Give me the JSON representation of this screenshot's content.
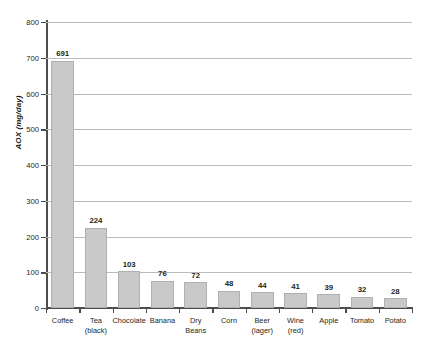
{
  "chart_data": {
    "type": "bar",
    "title": "",
    "xlabel": "",
    "ylabel": "AOX (mg/day)",
    "ylim": [
      0,
      800
    ],
    "ytick_values": [
      0,
      100,
      200,
      300,
      400,
      500,
      600,
      700,
      800
    ],
    "ytick_labels": [
      "0",
      "100",
      "200",
      "300",
      "400",
      "500",
      "600",
      "700",
      "800"
    ],
    "grid": true,
    "legend": false,
    "bar_color": "#c9c9c9",
    "bar_border_color": "#b0b0b0",
    "axis_color": "#4d4d4d",
    "gridline_color": "#b9bcbe",
    "text_color": "#231f20",
    "categories": [
      "Coffee",
      "Tea (black)",
      "Chocolate",
      "Banana",
      "Dry Beans",
      "Corn",
      "Beer (lager)",
      "Wine (red)",
      "Apple",
      "Tomato",
      "Potato"
    ],
    "category_lines": [
      [
        "Coffee"
      ],
      [
        "Tea",
        "(black)"
      ],
      [
        "Chocolate"
      ],
      [
        "Banana"
      ],
      [
        "Dry",
        "Beans"
      ],
      [
        "Corn"
      ],
      [
        "Beer",
        "(lager)"
      ],
      [
        "Wine",
        "(red)"
      ],
      [
        "Apple"
      ],
      [
        "Tomato"
      ],
      [
        "Potato"
      ]
    ],
    "values": [
      691,
      224,
      103,
      76,
      72,
      48,
      44,
      41,
      39,
      32,
      28
    ],
    "value_labels": [
      "691",
      "224",
      "103",
      "76",
      "72",
      "48",
      "44",
      "41",
      "39",
      "32",
      "28"
    ]
  }
}
